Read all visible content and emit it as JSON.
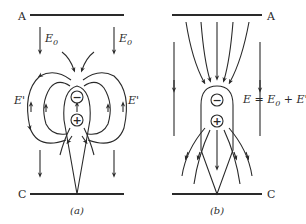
{
  "figure": {
    "panels": [
      {
        "id": "a",
        "caption": "(a)",
        "top_plate_label": "A",
        "bottom_plate_label": "C",
        "field_labels": {
          "external_left": "E",
          "external_left_sub": "0",
          "external_right": "E",
          "external_right_sub": "0",
          "induced_left": "E'",
          "induced_right": "E'"
        },
        "charges": {
          "top": "−",
          "bottom": "+"
        }
      },
      {
        "id": "b",
        "caption": "(b)",
        "top_plate_label": "A",
        "bottom_plate_label": "C",
        "equation": {
          "lhs": "E",
          "eq": " = ",
          "term1": "E",
          "term1_sub": "0",
          "plus": " + ",
          "term2": "E'"
        },
        "charges": {
          "top": "−",
          "bottom": "+"
        }
      }
    ],
    "colors": {
      "ink": "#2a2a2a",
      "background": "#ffffff"
    }
  }
}
